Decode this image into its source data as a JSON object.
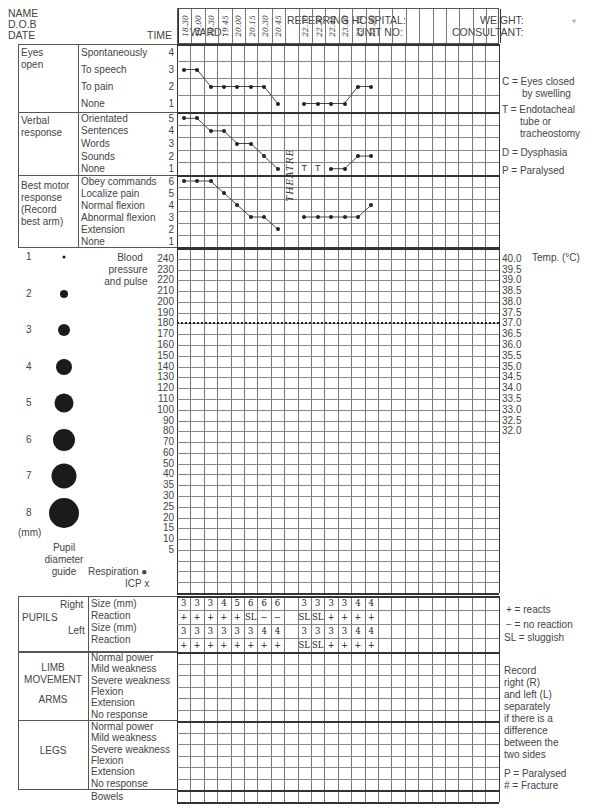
{
  "header": {
    "name_label": "NAME",
    "dob_label": "D.O.B",
    "date_label": "DATE",
    "ward_label": "WARD:",
    "referring_label": "REFERRING HOSPITAL:",
    "unit_label": "UNIT NO:",
    "weight_label": "WEIGHT:",
    "consultant_label": "CONSULTANT:",
    "time_label": "TIME",
    "times": [
      "18.30",
      "19.00",
      "19.30",
      "19.45",
      "20.00",
      "20.15",
      "20.30",
      "20.45",
      "",
      "22.10",
      "22.30",
      "22.45",
      "23.00",
      "23.15",
      "23.30",
      "",
      "",
      "",
      "",
      "",
      "",
      "",
      "",
      ""
    ]
  },
  "coma_scale": {
    "eyes": {
      "title_line1": "Eyes",
      "title_line2": "open",
      "options": [
        {
          "label": "Spontaneously",
          "score": "4"
        },
        {
          "label": "To speech",
          "score": "3"
        },
        {
          "label": "To pain",
          "score": "2"
        },
        {
          "label": "None",
          "score": "1"
        }
      ],
      "values": [
        3,
        3,
        2,
        2,
        2,
        2,
        2,
        1,
        null,
        1,
        1,
        1,
        1,
        2,
        2
      ]
    },
    "verbal": {
      "title_line1": "Verbal",
      "title_line2": "response",
      "options": [
        {
          "label": "Orientated",
          "score": "5"
        },
        {
          "label": "Sentences",
          "score": "4"
        },
        {
          "label": "Words",
          "score": "3"
        },
        {
          "label": "Sounds",
          "score": "2"
        },
        {
          "label": "None",
          "score": "1"
        }
      ],
      "values": [
        5,
        5,
        4,
        4,
        3,
        3,
        2,
        1,
        null,
        "T",
        "T",
        1,
        1,
        2,
        2
      ]
    },
    "motor": {
      "title_line1": "Best motor",
      "title_line2": "response",
      "title_line3": "(Record",
      "title_line4": "best arm)",
      "options": [
        {
          "label": "Obey commands",
          "score": "6"
        },
        {
          "label": "Localize pain",
          "score": "5"
        },
        {
          "label": "Normal flexion",
          "score": "4"
        },
        {
          "label": "Abnormal flexion",
          "score": "3"
        },
        {
          "label": "Extension",
          "score": "2"
        },
        {
          "label": "None",
          "score": "1"
        }
      ],
      "values": [
        6,
        6,
        6,
        5,
        4,
        3,
        3,
        2,
        null,
        3,
        3,
        3,
        3,
        3,
        4
      ]
    },
    "annotation": "THEATRE"
  },
  "legend_right": {
    "c": "C = Eyes closed",
    "c2": "by swelling",
    "t": "T = Endotacheal",
    "t2": "tube or",
    "t3": "tracheostomy",
    "d": "D = Dysphasia",
    "p": "P = Paralysed"
  },
  "vitals": {
    "bp_label1": "Blood",
    "bp_label2": "pressure",
    "bp_label3": "and pulse",
    "scale": [
      "240",
      "230",
      "220",
      "210",
      "200",
      "190",
      "180",
      "170",
      "160",
      "150",
      "140",
      "130",
      "120",
      "110",
      "100",
      "90",
      "80",
      "70",
      "60",
      "50",
      "40",
      "35",
      "30",
      "25",
      "20",
      "15",
      "10",
      "5"
    ],
    "temp_label": "Temp. (°C)",
    "temp_scale": [
      "40.0",
      "39.5",
      "39.0",
      "38.5",
      "38.0",
      "37.5",
      "37.0",
      "36.5",
      "36.0",
      "35.5",
      "35.0",
      "34.5",
      "34.0",
      "33.5",
      "33.0",
      "32.5",
      "32.0"
    ],
    "resp_label": "Respiration ●",
    "icp_label": "ICP x"
  },
  "pupil_guide": {
    "sizes": [
      "1",
      "2",
      "3",
      "4",
      "5",
      "6",
      "7",
      "8"
    ],
    "unit": "(mm)",
    "caption1": "Pupil",
    "caption2": "diameter",
    "caption3": "guide"
  },
  "pupils": {
    "title": "PUPILS",
    "right_label": "Right",
    "left_label": "Left",
    "rows": [
      "Size (mm)",
      "Reaction",
      "Size (mm)",
      "Reaction"
    ],
    "right_size": [
      "3",
      "3",
      "3",
      "4",
      "5",
      "6",
      "6",
      "6",
      "",
      "3",
      "3",
      "3",
      "3",
      "4",
      "4"
    ],
    "right_reaction": [
      "+",
      "+",
      "+",
      "+",
      "+",
      "SL",
      "−",
      "−",
      "",
      "SL",
      "SL",
      "+",
      "+",
      "+",
      "+"
    ],
    "left_size": [
      "3",
      "3",
      "3",
      "3",
      "3",
      "3",
      "4",
      "4",
      "",
      "3",
      "3",
      "3",
      "3",
      "4",
      "4"
    ],
    "left_reaction": [
      "+",
      "+",
      "+",
      "+",
      "+",
      "+",
      "+",
      "+",
      "",
      "SL",
      "SL",
      "+",
      "+",
      "+",
      "+"
    ]
  },
  "pupil_key": {
    "plus": "+ = reacts",
    "minus": "− = no reaction",
    "sl": "SL = sluggish"
  },
  "limbs": {
    "title1": "LIMB",
    "title2": "MOVEMENT",
    "arms": "ARMS",
    "legs": "LEGS",
    "options": [
      "Normal power",
      "Mild weakness",
      "Severe weakness",
      "Flexion",
      "Extension",
      "No response"
    ],
    "bowels": "Bowels"
  },
  "limb_key": {
    "l1": "Record",
    "l2": "right (R)",
    "l3": "and left (L)",
    "l4": "separately",
    "l5": "if there is a",
    "l6": "difference",
    "l7": "between the",
    "l8": "two sides",
    "p": "P = Paralysed",
    "f": "# = Fracture"
  },
  "corner_mark": "*"
}
